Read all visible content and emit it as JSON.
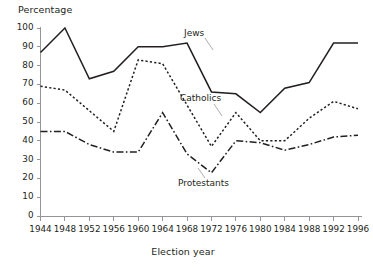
{
  "chart_data": {
    "type": "line",
    "title": "",
    "xlabel": "Election year",
    "ylabel": "Percentage",
    "x": [
      1944,
      1948,
      1952,
      1956,
      1960,
      1964,
      1968,
      1972,
      1976,
      1980,
      1984,
      1988,
      1992,
      1996
    ],
    "categories": [
      "1944",
      "1948",
      "1952",
      "1956",
      "1960",
      "1964",
      "1968",
      "1972",
      "1976",
      "1980",
      "1984",
      "1988",
      "1992",
      "1996"
    ],
    "xlim": [
      1944,
      1996
    ],
    "ylim": [
      0,
      100
    ],
    "y_ticks": [
      0,
      10,
      20,
      30,
      40,
      50,
      60,
      70,
      80,
      90,
      100
    ],
    "y_tick_labels": [
      "0",
      "10",
      "20",
      "30",
      "40",
      "50",
      "60",
      "70",
      "80",
      "90",
      "100"
    ],
    "grid": false,
    "legend_position": "inline-annotations",
    "series": [
      {
        "name": "Jews",
        "style": "solid",
        "color": "#231f20",
        "values": [
          87,
          100,
          73,
          77,
          90,
          90,
          92,
          66,
          65,
          55,
          68,
          71,
          92,
          92
        ]
      },
      {
        "name": "Catholics",
        "style": "dotted",
        "color": "#231f20",
        "values": [
          69,
          67,
          56,
          45,
          83,
          81,
          59,
          37,
          55,
          40,
          40,
          52,
          61,
          57
        ]
      },
      {
        "name": "Protestants",
        "style": "dash-dot",
        "color": "#231f20",
        "values": [
          45,
          45,
          38,
          34,
          34,
          55,
          33,
          23,
          40,
          39,
          35,
          38,
          42,
          43
        ]
      }
    ],
    "annotations": [
      {
        "text": "Jews",
        "series": "Jews"
      },
      {
        "text": "Catholics",
        "series": "Catholics"
      },
      {
        "text": "Protestants",
        "series": "Protestants"
      }
    ],
    "colors": {
      "ink": "#231f20",
      "axis": "#939598",
      "background": "#ffffff"
    }
  }
}
